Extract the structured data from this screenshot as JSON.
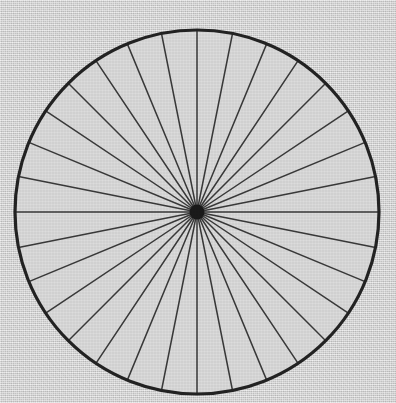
{
  "figure": {
    "caption": "",
    "background_color": "#d6d6d6",
    "interior_color": "#dcdcdc",
    "ink_color": "#2a2a2a",
    "rim_color": "#232323",
    "spoke_color": "#3a3a3a",
    "hub_color": "#1a1a1a",
    "canvas_width": 396,
    "canvas_height": 403
  },
  "chart_data": {
    "type": "pie",
    "title": "",
    "subtitle": "",
    "xlabel": "",
    "ylabel": "",
    "legend_position": "none",
    "grid": false,
    "center_x": 197,
    "center_y": 212,
    "radius": 182,
    "rim_stroke_width": 3.2,
    "spoke_stroke_width": 1.5,
    "hub_radius": 7.5,
    "spoke_count": 32,
    "spoke_angle_step_deg": 11.25,
    "start_angle_deg": -90,
    "categories": [
      "s1",
      "s2",
      "s3",
      "s4",
      "s5",
      "s6",
      "s7",
      "s8",
      "s9",
      "s10",
      "s11",
      "s12",
      "s13",
      "s14",
      "s15",
      "s16",
      "s17",
      "s18",
      "s19",
      "s20",
      "s21",
      "s22",
      "s23",
      "s24",
      "s25",
      "s26",
      "s27",
      "s28",
      "s29",
      "s30",
      "s31",
      "s32"
    ],
    "values": [
      11.25,
      11.25,
      11.25,
      11.25,
      11.25,
      11.25,
      11.25,
      11.25,
      11.25,
      11.25,
      11.25,
      11.25,
      11.25,
      11.25,
      11.25,
      11.25,
      11.25,
      11.25,
      11.25,
      11.25,
      11.25,
      11.25,
      11.25,
      11.25,
      11.25,
      11.25,
      11.25,
      11.25,
      11.25,
      11.25,
      11.25,
      11.25
    ],
    "spoke_angles_deg": [
      -90,
      -78.75,
      -67.5,
      -56.25,
      -45,
      -33.75,
      -22.5,
      -11.25,
      0,
      11.25,
      22.5,
      33.75,
      45,
      56.25,
      67.5,
      78.75,
      90,
      101.25,
      112.5,
      123.75,
      135,
      146.25,
      157.5,
      168.75,
      180,
      191.25,
      202.5,
      213.75,
      225,
      236.25,
      247.5,
      258.75
    ],
    "annotations": []
  }
}
